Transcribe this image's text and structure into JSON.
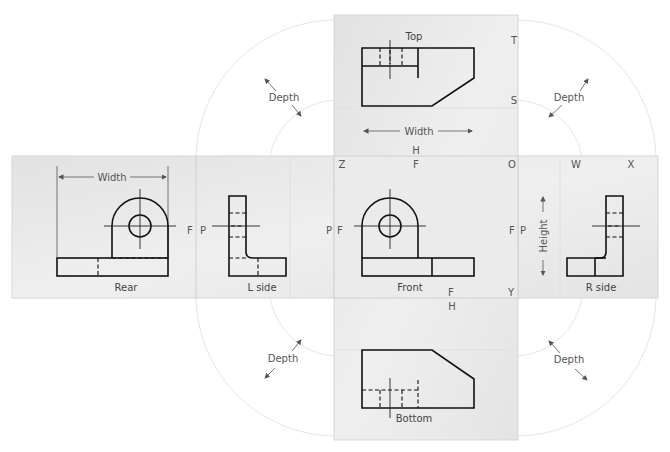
{
  "diagram": {
    "type": "glass-box orthographic projection",
    "views": {
      "top": {
        "label": "Top"
      },
      "front": {
        "label": "Front"
      },
      "bottom": {
        "label": "Bottom"
      },
      "rear": {
        "label": "Rear"
      },
      "left_side": {
        "label": "L side"
      },
      "right_side": {
        "label": "R side"
      }
    },
    "dimensions": {
      "width_top": "Width",
      "width_rear": "Width",
      "height": "Height",
      "depth_top_left": "Depth",
      "depth_top_right": "Depth",
      "depth_bottom_left": "Depth",
      "depth_bottom_right": "Depth"
    },
    "plane_letters": {
      "top_T": "T",
      "top_S": "S",
      "top_H": "H",
      "front_Z": "Z",
      "front_F_top": "F",
      "front_O": "O",
      "front_F_left": "F",
      "front_F_right": "F",
      "front_F_bottom": "F",
      "front_Y": "Y",
      "bottom_H": "H",
      "rear_F": "F",
      "lside_P_left": "P",
      "lside_P_right": "P",
      "rside_P": "P",
      "rside_W": "W",
      "rside_X": "X"
    },
    "colors": {
      "panel": "#e8e8e8",
      "panel_edge": "#d4d4d4",
      "line": "#111111",
      "label": "#555555"
    }
  }
}
